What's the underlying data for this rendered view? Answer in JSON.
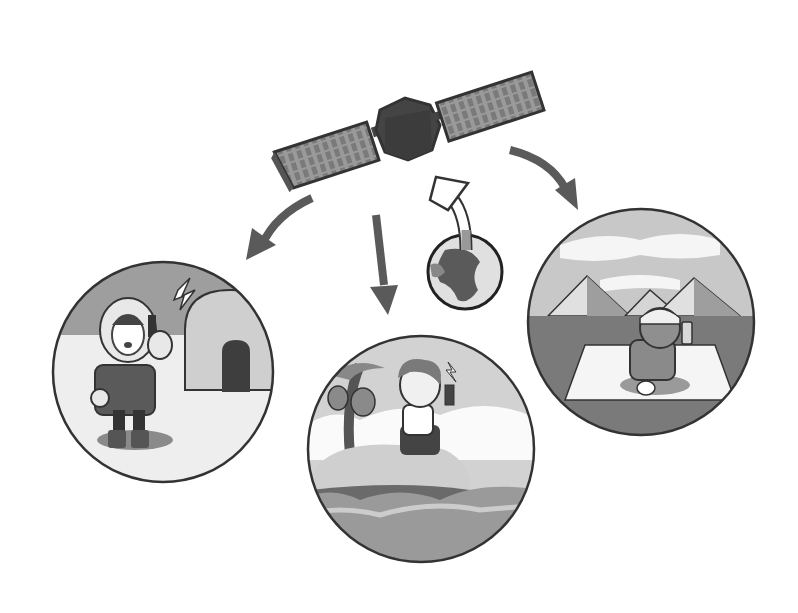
{
  "illustration": {
    "subject": "Satellite phone communication from remote locations",
    "colors": {
      "background": "#ffffff",
      "outline": "#333333",
      "dark": "#555555",
      "mid": "#8a8a8a",
      "light": "#bdbdbd",
      "pale": "#e6e6e6",
      "arrow": "#5a5a5a"
    },
    "satellite": {
      "label": "satellite"
    },
    "earth": {
      "label": "earth"
    },
    "scenes": [
      {
        "name": "arctic",
        "label": "Person in parka with satellite phone next to igloo"
      },
      {
        "name": "island",
        "label": "Boy on small island with palm tree calling on phone"
      },
      {
        "name": "desert",
        "label": "Traveler sitting on mat before pyramids with phone"
      }
    ]
  }
}
